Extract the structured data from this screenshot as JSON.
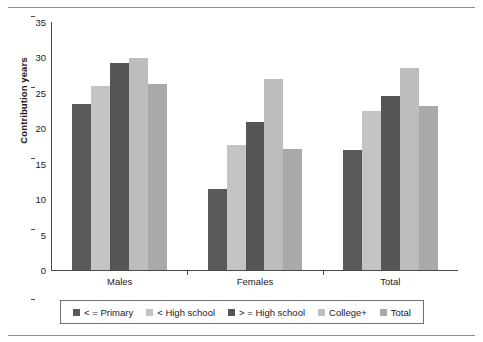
{
  "figure": {
    "background": "#ffffff",
    "rule_color": "#8d8d8d"
  },
  "chart_data": {
    "type": "bar",
    "title": "",
    "xlabel": "",
    "ylabel": "Contribution years",
    "categories": [
      "Males",
      "Females",
      "Total"
    ],
    "ylim": [
      0,
      35
    ],
    "yticks": [
      0,
      5,
      10,
      15,
      20,
      25,
      30,
      35
    ],
    "ytick_labels": [
      "0",
      "5",
      "10",
      "15",
      "20",
      "25",
      "30",
      "35"
    ],
    "grid": false,
    "legend_position": "bottom",
    "series": [
      {
        "name": "< = Primary",
        "color": "#5a5a5a",
        "values": [
          23.5,
          11.5,
          17.0
        ]
      },
      {
        "name": "< High school",
        "color": "#c4c4c4",
        "values": [
          26.0,
          17.6,
          22.4
        ]
      },
      {
        "name": "> = High school",
        "color": "#555555",
        "values": [
          29.2,
          20.9,
          24.6
        ]
      },
      {
        "name": "College+",
        "color": "#bdbdbd",
        "values": [
          29.9,
          27.0,
          28.5
        ]
      },
      {
        "name": "Total",
        "color": "#a9a9a9",
        "values": [
          26.3,
          17.1,
          23.2
        ]
      }
    ]
  }
}
